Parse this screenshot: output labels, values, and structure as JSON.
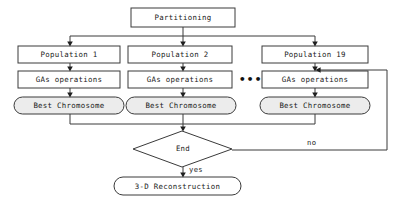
{
  "diagram": {
    "type": "flowchart",
    "canvas": {
      "width": 404,
      "height": 203,
      "background": "#ffffff"
    },
    "colors": {
      "stroke": "#333333",
      "process_fill": "#ffffff",
      "terminal_fill": "#ececec",
      "decision_fill": "#ffffff",
      "text": "#1a1a1a"
    },
    "nodes": {
      "partitioning": {
        "label": "Partitioning",
        "shape": "rect"
      },
      "population_1": {
        "label": "Population 1",
        "shape": "rect"
      },
      "population_2": {
        "label": "Population 2",
        "shape": "rect"
      },
      "population_19": {
        "label": "Population 19",
        "shape": "rect"
      },
      "gas_operations_1": {
        "label": "GAs operations",
        "shape": "rect"
      },
      "gas_operations_2": {
        "label": "GAs operations",
        "shape": "rect"
      },
      "gas_operations_3": {
        "label": "GAs operations",
        "shape": "rect"
      },
      "best_chromosome_1": {
        "label": "Best Chromosome",
        "shape": "stadium"
      },
      "best_chromosome_2": {
        "label": "Best Chromosome",
        "shape": "stadium"
      },
      "best_chromosome_3": {
        "label": "Best Chromosome",
        "shape": "stadium"
      },
      "end_decision": {
        "label": "End",
        "shape": "diamond"
      },
      "reconstruction": {
        "label": "3-D Reconstruction",
        "shape": "stadium"
      }
    },
    "edge_labels": {
      "yes": "yes",
      "no": "no"
    },
    "ellipsis": "•••"
  }
}
